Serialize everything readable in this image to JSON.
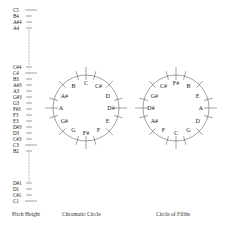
{
  "pitch_height": {
    "caption": "Pitch Height",
    "labels_top": [
      {
        "label": "C5",
        "y": 10
      },
      {
        "label": "B4",
        "y": 16
      },
      {
        "label": "A#4",
        "y": 22
      },
      {
        "label": "A4",
        "y": 28
      }
    ],
    "labels_mid": [
      {
        "label": "C#4",
        "y": 67
      },
      {
        "label": "C4",
        "y": 73
      },
      {
        "label": "B3",
        "y": 79
      },
      {
        "label": "A#3",
        "y": 85
      },
      {
        "label": "A3",
        "y": 91
      },
      {
        "label": "G#3",
        "y": 97
      },
      {
        "label": "G3",
        "y": 103
      },
      {
        "label": "F#3",
        "y": 109
      },
      {
        "label": "F3",
        "y": 115
      },
      {
        "label": "E3",
        "y": 121
      },
      {
        "label": "D#3",
        "y": 127
      },
      {
        "label": "D3",
        "y": 133
      },
      {
        "label": "C#3",
        "y": 139
      },
      {
        "label": "C3",
        "y": 145
      },
      {
        "label": "B2",
        "y": 151
      }
    ],
    "labels_bottom": [
      {
        "label": "D#1",
        "y": 183
      },
      {
        "label": "D1",
        "y": 189
      },
      {
        "label": "C#1",
        "y": 195
      },
      {
        "label": "C1",
        "y": 201
      }
    ]
  },
  "chromatic_circle": {
    "caption": "Chromatic Circle",
    "notes": [
      "C",
      "C#",
      "D",
      "D#",
      "E",
      "F",
      "F#",
      "G",
      "G#",
      "A",
      "A#",
      "B"
    ]
  },
  "circle_of_fifths": {
    "caption": "Circle of Fifths",
    "notes": [
      "F#",
      "B",
      "E",
      "A",
      "D",
      "G",
      "C",
      "F",
      "A#",
      "D#",
      "G#",
      "C#"
    ]
  }
}
